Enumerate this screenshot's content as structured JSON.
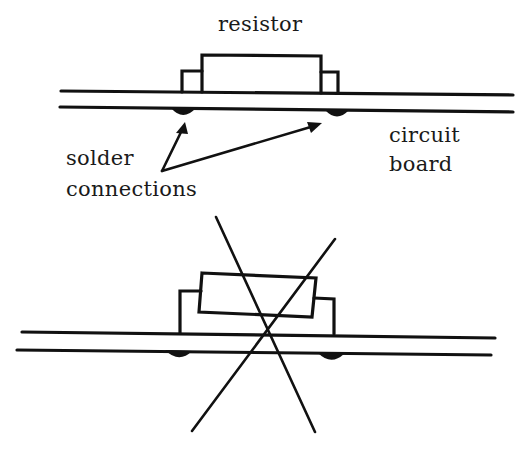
{
  "figure": {
    "top_panel": {
      "description": "correct mounting: resistor body lies flat on circuit board",
      "labels": {
        "resistor": "resistor",
        "solder_line1": "solder",
        "solder_line2": "connections",
        "board_line1": "circuit",
        "board_line2": "board"
      }
    },
    "bottom_panel": {
      "description": "incorrect mounting: resistor raised and tilted above board, crossed out",
      "mark": "X"
    }
  },
  "colors": {
    "ink": "#111111",
    "background": "#ffffff"
  }
}
